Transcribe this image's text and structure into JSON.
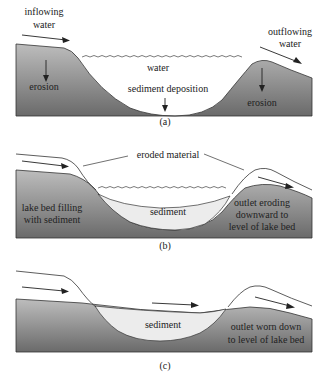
{
  "colors": {
    "ground_light": "#b8b8b8",
    "ground_dark": "#6e6e6e",
    "sediment": "#ececec",
    "water": "#ffffff",
    "line": "#333333",
    "text": "#222222"
  },
  "panels": [
    {
      "id": "a",
      "caption": "(a)",
      "labels": {
        "inflowing": "inflowing",
        "inflowing2": "water",
        "outflowing": "outflowing",
        "outflowing2": "water",
        "water": "water",
        "sediment_deposition": "sediment deposition",
        "erosion_left": "erosion",
        "erosion_right": "erosion"
      }
    },
    {
      "id": "b",
      "caption": "(b)",
      "labels": {
        "eroded_material": "eroded material",
        "lake_bed_1": "lake bed filling",
        "lake_bed_2": "with sediment",
        "sediment": "sediment",
        "outlet_1": "outlet eroding",
        "outlet_2": "downward to",
        "outlet_3": "level of lake bed"
      }
    },
    {
      "id": "c",
      "caption": "(c)",
      "labels": {
        "sediment": "sediment",
        "outlet_1": "outlet worn down",
        "outlet_2": "to level of lake bed"
      }
    }
  ]
}
